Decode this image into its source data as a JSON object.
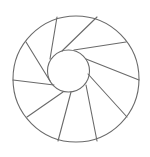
{
  "diagram": {
    "type": "annulus-with-shutter-spokes",
    "canvas": {
      "width": 150,
      "height": 157,
      "background": "#ffffff"
    },
    "stroke": {
      "color": "#6a6a6a",
      "width": 1.1
    },
    "outer_circle": {
      "cx": 76,
      "cy": 79,
      "r": 63
    },
    "inner_circle": {
      "cx": 68.5,
      "cy": 71,
      "r": 21
    },
    "spokes": [
      {
        "x1": 57,
        "y1": 17,
        "x2": 50,
        "y2": 59
      },
      {
        "x1": 26,
        "y1": 42,
        "x2": 50,
        "y2": 81
      },
      {
        "x1": 13,
        "y1": 80,
        "x2": 54,
        "y2": 85
      },
      {
        "x1": 27,
        "y1": 117,
        "x2": 63,
        "y2": 92
      },
      {
        "x1": 58,
        "y1": 141,
        "x2": 71,
        "y2": 92
      },
      {
        "x1": 97,
        "y1": 141,
        "x2": 86,
        "y2": 85
      },
      {
        "x1": 127,
        "y1": 117,
        "x2": 88,
        "y2": 74
      },
      {
        "x1": 139,
        "y1": 80,
        "x2": 86,
        "y2": 59
      },
      {
        "x1": 126,
        "y1": 42,
        "x2": 74,
        "y2": 50
      },
      {
        "x1": 97,
        "y1": 17,
        "x2": 62,
        "y2": 51
      }
    ]
  }
}
